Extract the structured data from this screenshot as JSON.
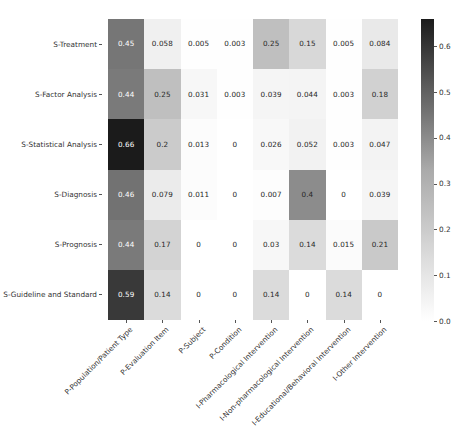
{
  "chart_data": {
    "type": "heatmap",
    "title": "",
    "xlabel": "",
    "ylabel": "",
    "grid": false,
    "annotated": true,
    "colormap": "Greys",
    "row_labels": [
      "S-Treatment",
      "S-Factor Analysis",
      "S-Statistical Analysis",
      "S-Diagnosis",
      "S-Prognosis",
      "S-Guideline and Standard"
    ],
    "column_labels": [
      "P-Population/Patient Type",
      "P-Evaluation Item",
      "P-Subject",
      "P-Condition",
      "I-Pharmacological Intervention",
      "I-Non-pharmacological Intervention",
      "I-Educational/Behavioral Intervention",
      "I-Other Intervention"
    ],
    "values": [
      [
        0.45,
        0.058,
        0.005,
        0.003,
        0.25,
        0.15,
        0.005,
        0.084
      ],
      [
        0.44,
        0.25,
        0.031,
        0.003,
        0.039,
        0.044,
        0.003,
        0.18
      ],
      [
        0.66,
        0.2,
        0.013,
        0,
        0.026,
        0.052,
        0.003,
        0.047
      ],
      [
        0.46,
        0.079,
        0.011,
        0,
        0.007,
        0.4,
        0,
        0.039
      ],
      [
        0.44,
        0.17,
        0,
        0,
        0.03,
        0.14,
        0.015,
        0.21
      ],
      [
        0.59,
        0.14,
        0,
        0,
        0.14,
        0,
        0.14,
        0
      ]
    ],
    "value_labels": [
      [
        "0.45",
        "0.058",
        "0.005",
        "0.003",
        "0.25",
        "0.15",
        "0.005",
        "0.084"
      ],
      [
        "0.44",
        "0.25",
        "0.031",
        "0.003",
        "0.039",
        "0.044",
        "0.003",
        "0.18"
      ],
      [
        "0.66",
        "0.2",
        "0.013",
        "0",
        "0.026",
        "0.052",
        "0.003",
        "0.047"
      ],
      [
        "0.46",
        "0.079",
        "0.011",
        "0",
        "0.007",
        "0.4",
        "0",
        "0.039"
      ],
      [
        "0.44",
        "0.17",
        "0",
        "0",
        "0.03",
        "0.14",
        "0.015",
        "0.21"
      ],
      [
        "0.59",
        "0.14",
        "0",
        "0",
        "0.14",
        "0",
        "0.14",
        "0"
      ]
    ],
    "vmin": 0,
    "vmax": 0.66,
    "colorbar": {
      "tick_labels": [
        "0.0",
        "0.1",
        "0.2",
        "0.3",
        "0.4",
        "0.5",
        "0.6"
      ],
      "tick_values": [
        0.0,
        0.1,
        0.2,
        0.3,
        0.4,
        0.5,
        0.6
      ],
      "position": "right"
    }
  },
  "colors": {
    "background": "#ffffff",
    "tick_label": "#333333",
    "tick_mark": "#555555",
    "dark_text": "#262626",
    "light_text": "#ffffff",
    "cmap_low": "#ffffff",
    "cmap_high": "#1b1b1b"
  }
}
